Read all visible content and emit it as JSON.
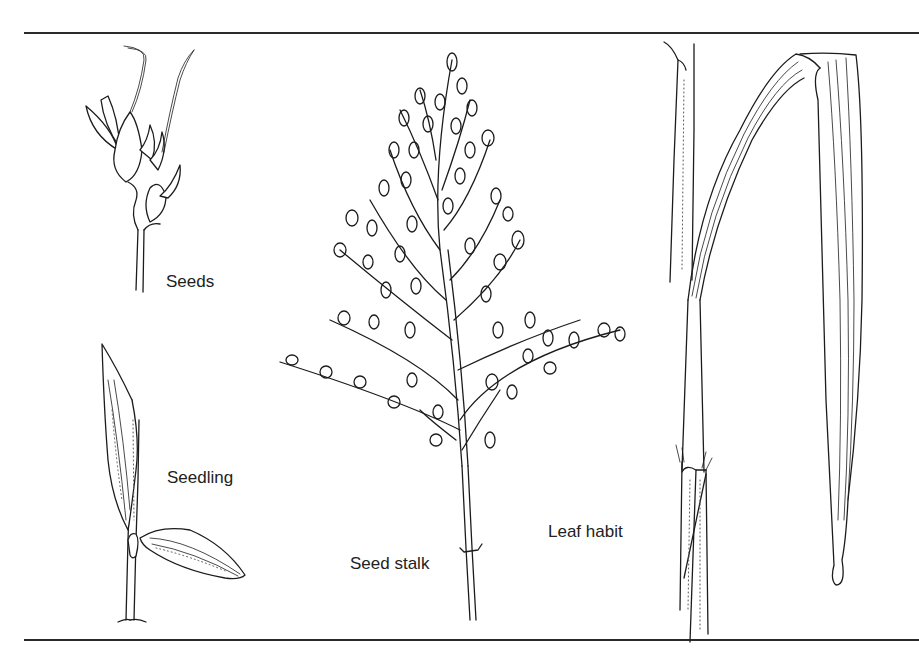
{
  "figure": {
    "labels": {
      "seeds": "Seeds",
      "seedling": "Seedling",
      "seed_stalk": "Seed stalk",
      "leaf_habit": "Leaf habit"
    },
    "colors": {
      "ink": "#1c1c1c",
      "rule": "#2a2a2a",
      "label": "#222222",
      "background": "#ffffff"
    }
  }
}
